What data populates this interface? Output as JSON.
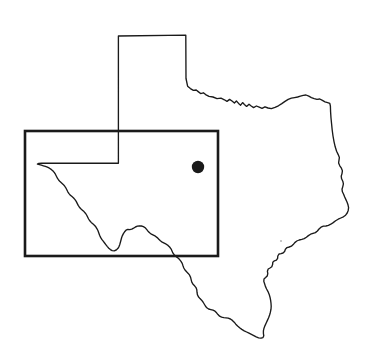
{
  "figure": {
    "title": "Texas state outline map with study area rectangle and site marker",
    "background_color": "#ffffff",
    "width": 377,
    "height": 357,
    "caption": ""
  },
  "map": {
    "subject": "Texas",
    "projection_style": "simple outline",
    "line_color": "#1a1a1a",
    "outline_stroke_width": 1.35,
    "fill": "none",
    "features": [
      {
        "name": "state-boundary",
        "label": "Texas state boundary",
        "type": "polyline-closed",
        "color": "#1a1a1a"
      },
      {
        "name": "study-area-rectangle",
        "label": "Study area rectangle",
        "type": "rectangle",
        "color": "#1a1a1a",
        "stroke_width": 2.6,
        "x": 25,
        "y": 131,
        "width": 193,
        "height": 125
      },
      {
        "name": "site-marker",
        "label": "Site location marker",
        "type": "filled-circle",
        "color": "#1a1a1a",
        "cx": 198,
        "cy": 167,
        "r": 6.2
      },
      {
        "name": "coast-speck",
        "label": "Small print speck near coast",
        "type": "dot",
        "color": "#b9b9b9",
        "cx": 281,
        "cy": 241,
        "r": 1.1
      }
    ]
  },
  "legend": {
    "present": false,
    "items": []
  },
  "labels": {
    "present": false,
    "items": []
  },
  "scale_bar": {
    "present": false
  },
  "north_arrow": {
    "present": false
  }
}
